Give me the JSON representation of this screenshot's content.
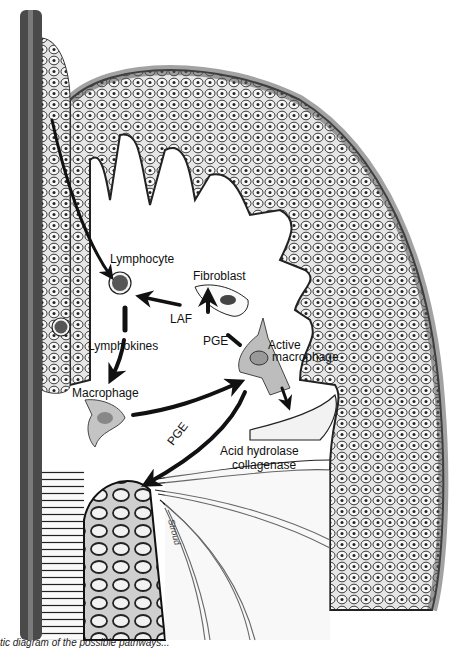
{
  "figure": {
    "labels": {
      "lymphocyte": "Lymphocyte",
      "fibroblast": "Fibroblast",
      "laf": "LAF",
      "pge_top": "PGE",
      "active_macrophage_1": "Active",
      "active_macrophage_2": "macrophage",
      "lymphokines": "Lymphokines",
      "macrophage": "Macrophage",
      "pge_bottom": "PGE",
      "acid_hydrolase": "Acid hydrolase",
      "collagenase": "collagenase"
    },
    "caption": "tic diagram of the possible pathways...",
    "colors": {
      "background": "#ffffff",
      "ink": "#111111",
      "tissue_fill": "#d9d9d9",
      "tooth_bar": "#555555",
      "macrophage_fill": "#bdbdbd"
    }
  }
}
